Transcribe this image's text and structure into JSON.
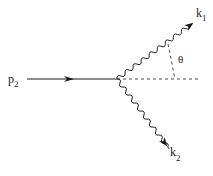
{
  "diagram": {
    "type": "feynman-diagram",
    "labels": {
      "incoming": "p",
      "incoming_sub": "2",
      "outgoing_upper": "k",
      "outgoing_upper_sub": "1",
      "outgoing_lower": "k",
      "outgoing_lower_sub": "2",
      "angle": "θ"
    },
    "lines": [
      {
        "id": "p2",
        "style": "solid",
        "arrow": "forward",
        "from": [
          27,
          79
        ],
        "to": [
          117,
          79
        ]
      },
      {
        "id": "k1",
        "style": "wavy",
        "arrow": "end",
        "from": [
          117,
          79
        ],
        "to": [
          193,
          23
        ]
      },
      {
        "id": "k2",
        "style": "wavy",
        "arrow": "end",
        "from": [
          117,
          79
        ],
        "to": [
          167,
          146
        ]
      },
      {
        "id": "axis",
        "style": "dashed",
        "from": [
          117,
          79
        ],
        "to": [
          200,
          79
        ]
      },
      {
        "id": "angle-marker",
        "style": "dashed",
        "from": [
          168,
          44
        ],
        "to": [
          175,
          79
        ]
      }
    ],
    "colors": {
      "ink": "#1a1a1a",
      "background": "#ffffff"
    }
  }
}
